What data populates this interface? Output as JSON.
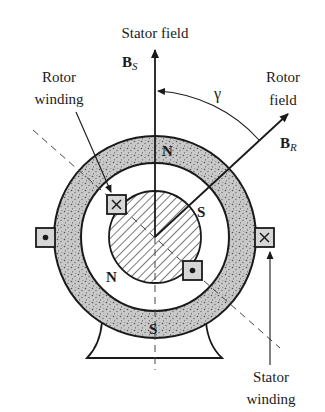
{
  "diagram": {
    "labels": {
      "stator_field": "Stator field",
      "rotor_winding_line1": "Rotor",
      "rotor_winding_line2": "winding",
      "rotor_field_line1": "Rotor",
      "rotor_field_line2": "field",
      "stator_winding_line1": "Stator",
      "stator_winding_line2": "winding",
      "angle_symbol": "γ",
      "bs_main": "B",
      "bs_sub": "S",
      "br_main": "B",
      "br_sub": "R"
    },
    "poles": {
      "stator_top": "N",
      "stator_bottom": "S",
      "rotor_upper_right": "S",
      "rotor_lower_left": "N"
    },
    "conductors": [
      {
        "id": "rotor-upper-left",
        "symbol": "cross",
        "meaning": "current into page"
      },
      {
        "id": "rotor-lower-right",
        "symbol": "dot",
        "meaning": "current out of page"
      },
      {
        "id": "stator-left",
        "symbol": "dot",
        "meaning": "current out of page"
      },
      {
        "id": "stator-right",
        "symbol": "cross",
        "meaning": "current into page"
      }
    ],
    "vectors": [
      {
        "name": "B_S",
        "direction": "vertical up",
        "meaning": "stator magnetic field"
      },
      {
        "name": "B_R",
        "direction": "upper right",
        "meaning": "rotor magnetic field"
      }
    ],
    "colors": {
      "stroke": "#1a1a1a",
      "stator_fill": "#c9c9c9",
      "stipple": "#555555",
      "box_fill": "#d6d6d6",
      "hatch": "#333333"
    }
  }
}
